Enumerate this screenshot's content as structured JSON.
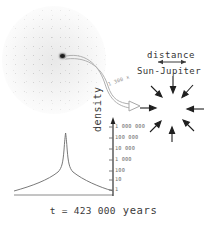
{
  "figure": {
    "title_caption": "t = 423 000 years",
    "caption_prefix": "t = ",
    "caption_value": "423 000",
    "caption_unit": "years"
  },
  "annotations": {
    "distance_label": "distance",
    "sun_jupiter_label": "Sun-Jupiter",
    "magnification_label": "1 300 x"
  },
  "clusters": {
    "left": {
      "name": "diffuse-cloud",
      "core_color": "#1d1d1d",
      "halo_color": "#8c8c8c"
    },
    "right": {
      "name": "collapsed-cluster",
      "core_color": "#141414",
      "arrow_count": 8
    }
  },
  "colors": {
    "ink": "#3b3b3b",
    "muted": "#6e6e6e",
    "faint": "#8d8d8d",
    "background": "#ffffff"
  },
  "chart_data": {
    "type": "line",
    "title": "",
    "xlabel": "",
    "ylabel": "density",
    "y_scale": "log",
    "grid": false,
    "legend": false,
    "ytick_labels": [
      "1 000 000",
      "100 000",
      "10 000",
      "1 000",
      "100",
      "10",
      "1"
    ],
    "ytick_values": [
      1000000,
      100000,
      10000,
      1000,
      100,
      10,
      1
    ],
    "ylim": [
      1,
      1000000
    ],
    "x": [
      -1.0,
      -0.85,
      -0.7,
      -0.55,
      -0.4,
      -0.3,
      -0.22,
      -0.15,
      -0.1,
      -0.06,
      -0.035,
      -0.018,
      -0.008,
      -0.003,
      0.0,
      0.003,
      0.008,
      0.018,
      0.035,
      0.06,
      0.1,
      0.15,
      0.22,
      0.3,
      0.4,
      0.55,
      0.7,
      0.85,
      1.0
    ],
    "values": [
      1,
      2,
      4,
      8,
      16,
      30,
      55,
      110,
      230,
      520,
      1400,
      4200,
      16000,
      90000,
      900000,
      90000,
      16000,
      4200,
      1400,
      520,
      230,
      110,
      55,
      30,
      16,
      8,
      4,
      2,
      1
    ],
    "series": [
      {
        "name": "density-profile",
        "values": [
          1,
          2,
          4,
          8,
          16,
          30,
          55,
          110,
          230,
          520,
          1400,
          4200,
          16000,
          90000,
          900000,
          90000,
          16000,
          4200,
          1400,
          520,
          230,
          110,
          55,
          30,
          16,
          8,
          4,
          2,
          1
        ]
      }
    ]
  }
}
